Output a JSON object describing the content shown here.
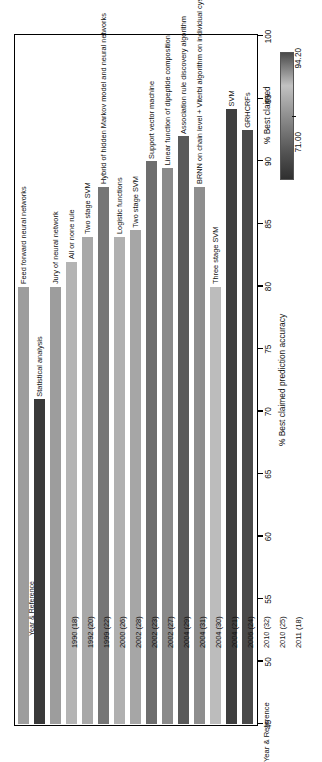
{
  "chart_data": {
    "type": "bar",
    "orientation": "horizontal",
    "title": "",
    "xlabel": "% Best claimed prediction accuracy",
    "ylabel": "Year & Reference",
    "xlim": [
      45,
      100
    ],
    "xticks": [
      45,
      50,
      55,
      60,
      65,
      70,
      75,
      80,
      85,
      90,
      95,
      100
    ],
    "xtick_labels": [
      "45",
      "50",
      "55",
      "60",
      "65",
      "70",
      "75",
      "80",
      "85",
      "90",
      "95",
      "100"
    ],
    "grid": false,
    "legend": {
      "position": "right",
      "title": "% Best claimed",
      "min_label": "71.00",
      "max_label": "94.20",
      "min_value": 71.0,
      "max_value": 94.2,
      "colormap": "grayscale"
    },
    "categories": [
      "1990 (18)",
      "1992 (20)",
      "1999 (22)",
      "2000 (26)",
      "2002 (28)",
      "2002 (23)",
      "2002 (27)",
      "2004 (29)",
      "2004 (31)",
      "2004 (30)",
      "2004 (21)",
      "2006 (24)",
      "2010 (32)",
      "2010 (25)",
      "2011 (18)"
    ],
    "values": [
      80.0,
      71.0,
      80.0,
      82.0,
      84.0,
      88.0,
      84.0,
      84.5,
      90.0,
      89.5,
      92.0,
      88.0,
      80.0,
      94.2,
      92.5
    ],
    "point_labels": [
      "Feed forward neural networks",
      "Statistical analysis",
      "Jury of neural network",
      "All or none rule",
      "Two stage SVM",
      "Hybrid of hidden Markov model and neural networks",
      "Logistic functions",
      "Two stage SVM",
      "Support vector machine",
      "Linear function of dipeptide composition",
      "Association rule discovery algorithm",
      "BRNN on chain level + Viterbi algorithm on individual cysteines",
      "Three stage SVM",
      "SVM",
      "GRHCRFs"
    ],
    "bar_colors": [
      "#9d9d9d",
      "#3a3a3a",
      "#9d9d9d",
      "#b4b4b4",
      "#a8a8a8",
      "#767676",
      "#b0b0b0",
      "#a6a6a6",
      "#6e6e6e",
      "#8a8a8a",
      "#5a5a5a",
      "#8e8e8e",
      "#bcbcbc",
      "#3f3f3f",
      "#4a4a4a"
    ]
  }
}
